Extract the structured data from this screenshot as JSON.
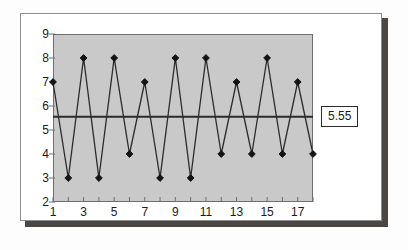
{
  "chart_data": {
    "type": "line",
    "title": "",
    "subtitle": "",
    "xlabel": "",
    "ylabel": "",
    "x": [
      1,
      2,
      3,
      4,
      5,
      6,
      7,
      8,
      9,
      10,
      11,
      12,
      13,
      14,
      15,
      16,
      17,
      18
    ],
    "values": [
      7,
      3,
      8,
      3,
      8,
      4,
      7,
      3,
      8,
      3,
      8,
      4,
      7,
      4,
      8,
      4,
      7,
      4
    ],
    "series": [
      {
        "name": "",
        "values": [
          7,
          3,
          8,
          3,
          8,
          4,
          7,
          3,
          8,
          3,
          8,
          4,
          7,
          4,
          8,
          4,
          7,
          4
        ]
      }
    ],
    "ylim": [
      2,
      9
    ],
    "xlim": [
      1,
      18
    ],
    "ytick_labels": [
      "2",
      "3",
      "4",
      "5",
      "6",
      "7",
      "8",
      "9"
    ],
    "ytick_values": [
      2,
      3,
      4,
      5,
      6,
      7,
      8,
      9
    ],
    "xtick_values": [
      1,
      2,
      3,
      4,
      5,
      6,
      7,
      8,
      9,
      10,
      11,
      12,
      13,
      14,
      15,
      16,
      17,
      18
    ],
    "xtick_labels_shown": [
      "1",
      "3",
      "5",
      "7",
      "9",
      "11",
      "13",
      "15",
      "17"
    ],
    "xtick_labeled_values": [
      1,
      3,
      5,
      7,
      9,
      11,
      13,
      15,
      17
    ],
    "grid": false,
    "legend": "none",
    "marker": "diamond",
    "reference_line": {
      "value": 5.55,
      "label": "5.55",
      "orientation": "horizontal"
    },
    "colors": {
      "plot_background": "#c9c9c9",
      "line": "#2b2b2b",
      "marker": "#141414",
      "reference_line": "#2b2b2b",
      "axis": "#6f6f6f",
      "text": "#1b1b1b",
      "card_background": "#ffffff",
      "card_border": "#8d8d8d",
      "shadow": "#4a4745"
    }
  }
}
